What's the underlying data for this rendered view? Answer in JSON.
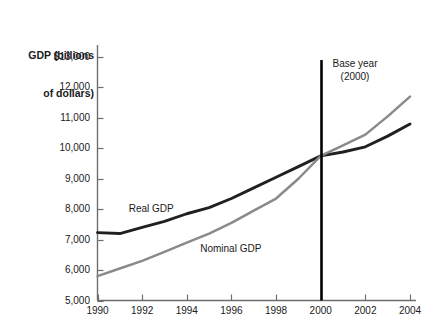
{
  "chart_data": {
    "type": "line",
    "title": "",
    "ylabel": "GDP (billions\nof dollars)",
    "xlabel": "",
    "x": [
      1990,
      1991,
      1992,
      1993,
      1994,
      1995,
      1996,
      1997,
      1998,
      1999,
      2000,
      2001,
      2002,
      2003,
      2004
    ],
    "xlim": [
      1990,
      2004
    ],
    "ylim": [
      5000,
      13000
    ],
    "grid": false,
    "legend_position": "inline-labels",
    "series": [
      {
        "name": "Real GDP",
        "color": "#231f20",
        "values": [
          7230,
          7200,
          7400,
          7600,
          7850,
          8050,
          8350,
          8700,
          9050,
          9400,
          9750,
          9880,
          10050,
          10400,
          10800
        ]
      },
      {
        "name": "Nominal GDP",
        "color": "#8a8a8a",
        "values": [
          5800,
          6050,
          6300,
          6600,
          6900,
          7200,
          7550,
          7950,
          8350,
          9000,
          9750,
          10100,
          10450,
          11050,
          11700
        ]
      }
    ],
    "annotations": [
      {
        "name": "base-year-marker",
        "line1": "Base year",
        "line2": "(2000)",
        "x": 2000,
        "y_top": 12900,
        "y_bottom": 5000
      }
    ],
    "y_ticks": [
      {
        "value": 13000,
        "label": "$13,000"
      },
      {
        "value": 12000,
        "label": "12,000"
      },
      {
        "value": 11000,
        "label": "11,000"
      },
      {
        "value": 10000,
        "label": "10,000"
      },
      {
        "value": 9000,
        "label": "9,000"
      },
      {
        "value": 8000,
        "label": "8,000"
      },
      {
        "value": 7000,
        "label": "7,000"
      },
      {
        "value": 6000,
        "label": "6,000"
      },
      {
        "value": 5000,
        "label": "5,000"
      }
    ],
    "x_ticks": [
      {
        "value": 1990,
        "label": "1990"
      },
      {
        "value": 1992,
        "label": "1992"
      },
      {
        "value": 1994,
        "label": "1994"
      },
      {
        "value": 1996,
        "label": "1996"
      },
      {
        "value": 1998,
        "label": "1998"
      },
      {
        "value": 2000,
        "label": "2000"
      },
      {
        "value": 2002,
        "label": "2002"
      },
      {
        "value": 2004,
        "label": "2004"
      }
    ],
    "series_inline_labels": [
      {
        "name": "Real GDP",
        "anchor_x": 1991.4,
        "anchor_y": 8020
      },
      {
        "name": "Nominal GDP",
        "anchor_x": 1994.6,
        "anchor_y": 6680
      }
    ]
  },
  "axis": {
    "y_title_line1": "GDP (billions",
    "y_title_line2": "of dollars)"
  },
  "colors": {
    "real_gdp": "#231f20",
    "nominal_gdp": "#8a8a8a",
    "axis": "#6e6e6e",
    "base_year_line": "#000000",
    "text": "#1a1a1a",
    "background": "#ffffff"
  }
}
